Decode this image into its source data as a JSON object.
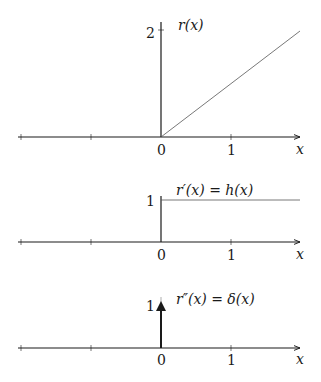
{
  "panels": [
    {
      "id": "ramp",
      "label": "r(x)",
      "y_tick_label": "2",
      "x_tick_labels": [
        "0",
        "1"
      ],
      "axis_label": "x",
      "curve": "ramp",
      "description": "r(x) = 0 for x<0, slope-1 ramp for x>=0"
    },
    {
      "id": "step",
      "label": "r′(x) = h(x)",
      "y_tick_label": "1",
      "x_tick_labels": [
        "0",
        "1"
      ],
      "axis_label": "x",
      "curve": "step",
      "description": "Heaviside step: 0 for x<0, 1 for x>=0"
    },
    {
      "id": "delta",
      "label": "r″(x) = δ(x)",
      "y_tick_label": "1",
      "x_tick_labels": [
        "0",
        "1"
      ],
      "axis_label": "x",
      "curve": "impulse",
      "description": "Dirac delta impulse at x=0 drawn as arrow of height 1"
    }
  ],
  "colors": {
    "axis": "#1a1a1a",
    "curve": "#555555",
    "background": "#ffffff"
  }
}
